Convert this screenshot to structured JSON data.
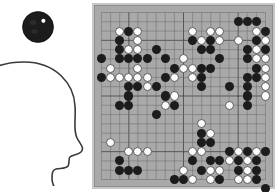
{
  "observer": {
    "head_label": "human-head-profile",
    "stone_label": "black-go-stone",
    "stone_color": "#1c1c1c",
    "stone_highlight_color": "#ffffff",
    "outline_color": "#3a3a3a"
  },
  "board": {
    "label": "go-board",
    "size": 19,
    "background_color": "#a9a9a9",
    "line_color": "#6e6e6e",
    "major_line_color": "#4f4f4f",
    "border_color": "#c8c8c8",
    "black_color": "#1c1c1c",
    "white_color": "#fbfbfb",
    "star_points": [
      [
        3,
        3
      ],
      [
        9,
        3
      ],
      [
        15,
        3
      ],
      [
        3,
        9
      ],
      [
        9,
        9
      ],
      [
        15,
        9
      ],
      [
        3,
        15
      ],
      [
        9,
        15
      ],
      [
        15,
        15
      ]
    ],
    "black_stones": [
      [
        15,
        1
      ],
      [
        16,
        1
      ],
      [
        17,
        1
      ],
      [
        3,
        2
      ],
      [
        18,
        2
      ],
      [
        2,
        3
      ],
      [
        10,
        3
      ],
      [
        12,
        3
      ],
      [
        17,
        3
      ],
      [
        2,
        4
      ],
      [
        6,
        4
      ],
      [
        11,
        4
      ],
      [
        12,
        4
      ],
      [
        16,
        4
      ],
      [
        18,
        4
      ],
      [
        0,
        5
      ],
      [
        2,
        5
      ],
      [
        3,
        5
      ],
      [
        4,
        5
      ],
      [
        5,
        5
      ],
      [
        7,
        5
      ],
      [
        13,
        5
      ],
      [
        16,
        5
      ],
      [
        8,
        6
      ],
      [
        11,
        6
      ],
      [
        12,
        6
      ],
      [
        17,
        6
      ],
      [
        0,
        7
      ],
      [
        7,
        7
      ],
      [
        11,
        7
      ],
      [
        16,
        7
      ],
      [
        17,
        7
      ],
      [
        3,
        8
      ],
      [
        4,
        8
      ],
      [
        6,
        8
      ],
      [
        11,
        8
      ],
      [
        14,
        8
      ],
      [
        16,
        8
      ],
      [
        3,
        9
      ],
      [
        7,
        9
      ],
      [
        16,
        9
      ],
      [
        2,
        10
      ],
      [
        3,
        10
      ],
      [
        8,
        10
      ],
      [
        16,
        10
      ],
      [
        6,
        11
      ],
      [
        11,
        13
      ],
      [
        11,
        14
      ],
      [
        12,
        14
      ],
      [
        14,
        15
      ],
      [
        16,
        15
      ],
      [
        18,
        15
      ],
      [
        2,
        16
      ],
      [
        10,
        16
      ],
      [
        12,
        16
      ],
      [
        13,
        16
      ],
      [
        15,
        16
      ],
      [
        17,
        16
      ],
      [
        2,
        17
      ],
      [
        3,
        17
      ],
      [
        4,
        17
      ],
      [
        11,
        17
      ],
      [
        15,
        17
      ],
      [
        17,
        17
      ],
      [
        8,
        18
      ],
      [
        9,
        18
      ],
      [
        13,
        18
      ],
      [
        17,
        18
      ],
      [
        18,
        19
      ]
    ],
    "white_stones": [
      [
        2,
        2
      ],
      [
        4,
        2
      ],
      [
        10,
        2
      ],
      [
        12,
        2
      ],
      [
        13,
        2
      ],
      [
        17,
        2
      ],
      [
        2,
        3
      ],
      [
        4,
        3
      ],
      [
        11,
        3
      ],
      [
        13,
        3
      ],
      [
        15,
        3
      ],
      [
        18,
        3
      ],
      [
        3,
        4
      ],
      [
        4,
        4
      ],
      [
        17,
        4
      ],
      [
        9,
        5
      ],
      [
        17,
        5
      ],
      [
        18,
        5
      ],
      [
        1,
        6
      ],
      [
        4,
        6
      ],
      [
        9,
        6
      ],
      [
        10,
        6
      ],
      [
        17,
        6
      ],
      [
        18,
        6
      ],
      [
        1,
        7
      ],
      [
        2,
        7
      ],
      [
        3,
        7
      ],
      [
        4,
        7
      ],
      [
        5,
        7
      ],
      [
        8,
        7
      ],
      [
        10,
        7
      ],
      [
        18,
        7
      ],
      [
        5,
        8
      ],
      [
        18,
        8
      ],
      [
        8,
        9
      ],
      [
        18,
        9
      ],
      [
        7,
        10
      ],
      [
        14,
        10
      ],
      [
        11,
        12
      ],
      [
        11,
        13
      ],
      [
        12,
        13
      ],
      [
        1,
        14
      ],
      [
        11,
        14
      ],
      [
        10,
        15
      ],
      [
        11,
        15
      ],
      [
        15,
        15
      ],
      [
        17,
        15
      ],
      [
        18,
        15
      ],
      [
        3,
        15
      ],
      [
        4,
        15
      ],
      [
        5,
        15
      ],
      [
        14,
        16
      ],
      [
        16,
        16
      ],
      [
        9,
        17
      ],
      [
        12,
        17
      ],
      [
        13,
        17
      ],
      [
        16,
        17
      ],
      [
        8,
        18
      ],
      [
        10,
        18
      ],
      [
        12,
        18
      ],
      [
        15,
        18
      ],
      [
        16,
        18
      ]
    ]
  }
}
